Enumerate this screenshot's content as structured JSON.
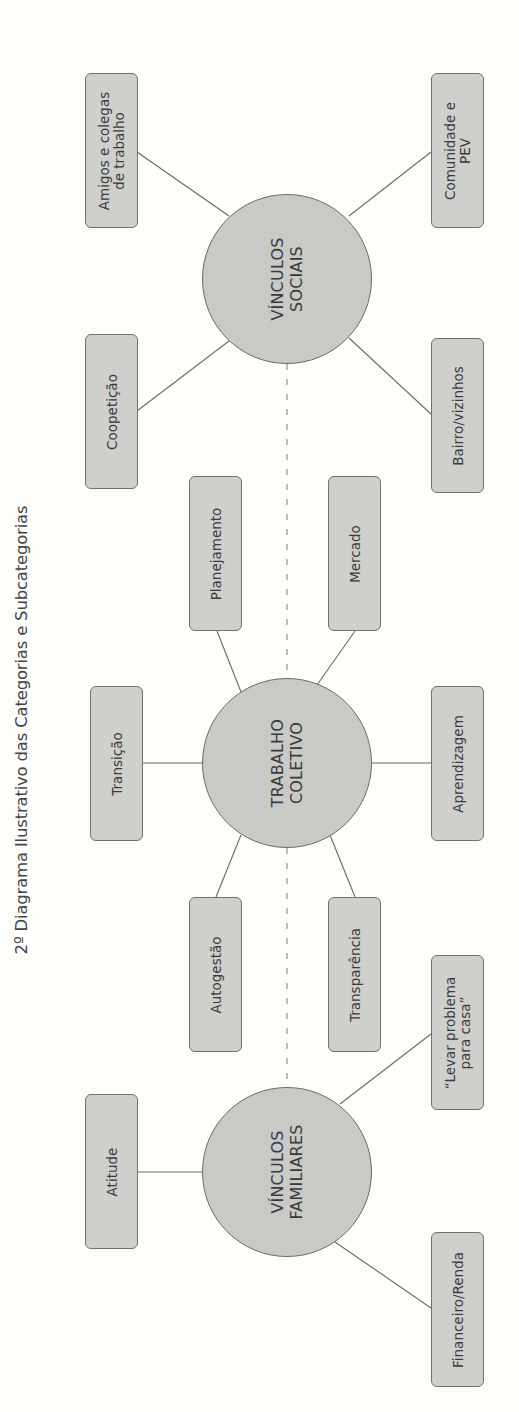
{
  "title": "2º Diagrama Ilustrativo das Categorias e Subcategorias",
  "colors": {
    "background": "#fdfdf9",
    "node_fill": "#cfcfcc",
    "hub_fill": "#c9c9c6",
    "stroke": "#6a6a6a",
    "divider": "#9a9a9a",
    "text": "#3a3a3a"
  },
  "categories": [
    {
      "id": "vinculos-sociais",
      "label_lines": [
        "VÍNCULOS",
        "SOCIAIS"
      ],
      "subcategories": [
        {
          "label_lines": [
            "Amigos e colegas",
            "de trabalho"
          ]
        },
        {
          "label_lines": [
            "Comunidade e",
            "PEV"
          ]
        },
        {
          "label_lines": [
            "Coopetição"
          ]
        },
        {
          "label_lines": [
            "Bairro/vizinhos"
          ]
        }
      ]
    },
    {
      "id": "trabalho-coletivo",
      "label_lines": [
        "TRABALHO",
        "COLETIVO"
      ],
      "subcategories": [
        {
          "label_lines": [
            "Planejamento"
          ]
        },
        {
          "label_lines": [
            "Mercado"
          ]
        },
        {
          "label_lines": [
            "Transição"
          ]
        },
        {
          "label_lines": [
            "Aprendizagem"
          ]
        },
        {
          "label_lines": [
            "Autogestão"
          ]
        },
        {
          "label_lines": [
            "Transparência"
          ]
        }
      ]
    },
    {
      "id": "vinculos-familiares",
      "label_lines": [
        "VÍNCULOS",
        "FAMILIARES"
      ],
      "subcategories": [
        {
          "label_lines": [
            "“Levar problema",
            "para casa”"
          ]
        },
        {
          "label_lines": [
            "Atitude"
          ]
        },
        {
          "label_lines": [
            "Financeiro/Renda"
          ]
        }
      ]
    }
  ]
}
